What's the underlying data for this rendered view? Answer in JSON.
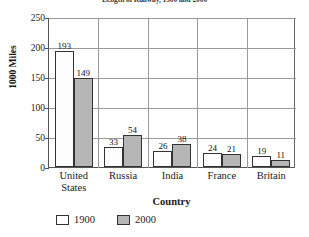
{
  "chart_data": {
    "type": "bar",
    "title": "Length of Railway, 1900 and 2000",
    "xlabel": "Country",
    "ylabel": "1000 Miles",
    "categories": [
      "United\nStates",
      "Russia",
      "India",
      "France",
      "Britain"
    ],
    "series": [
      {
        "name": "1900",
        "color": "#fdfdfd",
        "values": [
          193,
          33,
          26,
          24,
          19
        ]
      },
      {
        "name": "2000",
        "color": "#b6b6b6",
        "values": [
          149,
          54,
          38,
          21,
          11
        ]
      }
    ],
    "ylim": [
      0,
      250
    ],
    "yticks": [
      0,
      50,
      100,
      150,
      200,
      250
    ],
    "ytick_labels": [
      "0",
      "50",
      "100",
      "150",
      "200",
      "250"
    ],
    "grid": "both",
    "legend_position": "bottom-left",
    "bar_labels": true
  }
}
